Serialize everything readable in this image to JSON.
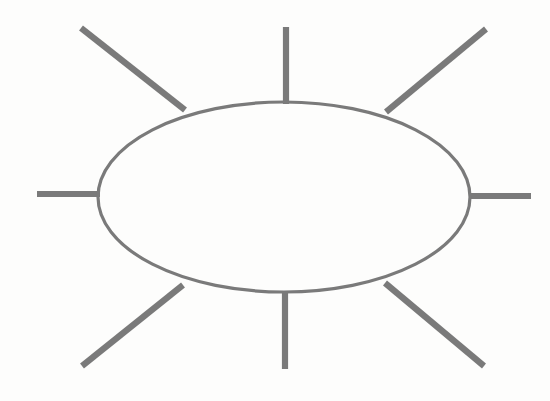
{
  "document": {
    "title": "Sun Diagram",
    "kind": "line-drawing",
    "description": "Hand-drawn oval with eight straight rays radiating outward"
  },
  "canvas": {
    "width": 550,
    "height": 401,
    "background_color": "#fdfdfc"
  },
  "style": {
    "stroke_color": "#7a7a7a",
    "ellipse_stroke_width": 3.2,
    "ray_stroke_width": 6.2
  },
  "shapes": {
    "ellipse": {
      "name": "central-oval",
      "cx": 284,
      "cy": 197,
      "rx": 186,
      "ry": 95
    },
    "rays": [
      {
        "name": "ray-top-left",
        "direction": "upper-left-diagonal",
        "x1": 185,
        "y1": 110,
        "x2": 81,
        "y2": 28
      },
      {
        "name": "ray-top-center",
        "direction": "up",
        "x1": 286,
        "y1": 104,
        "x2": 286,
        "y2": 27
      },
      {
        "name": "ray-top-right",
        "direction": "upper-right-diagonal",
        "x1": 386,
        "y1": 112,
        "x2": 486,
        "y2": 29
      },
      {
        "name": "ray-left",
        "direction": "left",
        "x1": 100,
        "y1": 194,
        "x2": 37,
        "y2": 194
      },
      {
        "name": "ray-right",
        "direction": "right",
        "x1": 469,
        "y1": 196,
        "x2": 531,
        "y2": 196
      },
      {
        "name": "ray-bottom-left",
        "direction": "lower-left-diagonal",
        "x1": 183,
        "y1": 285,
        "x2": 82,
        "y2": 366
      },
      {
        "name": "ray-bottom-center",
        "direction": "down",
        "x1": 285,
        "y1": 291,
        "x2": 285,
        "y2": 369
      },
      {
        "name": "ray-bottom-right",
        "direction": "lower-right-diagonal",
        "x1": 385,
        "y1": 283,
        "x2": 484,
        "y2": 366
      }
    ]
  }
}
